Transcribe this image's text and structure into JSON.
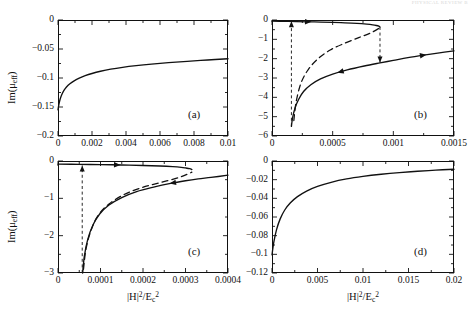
{
  "figure": {
    "header_artifact": "PHYSICAL REVIEW  B",
    "axis_title_x": "|H|2/Ec2",
    "axis_title_y": "Im(μeff)"
  },
  "chart_data": [
    {
      "type": "line",
      "panel": "(a)",
      "title": "",
      "xlabel": "|H|^2/E_c^2",
      "ylabel": "Im(mu_eff)",
      "xlim": [
        0,
        0.01
      ],
      "ylim": [
        -0.2,
        0
      ],
      "xticks": [
        0,
        0.002,
        0.004,
        0.006,
        0.008,
        0.01
      ],
      "xticklabels": [
        "0",
        "0.002",
        "0.004",
        "0.006",
        "0.008",
        "0.01"
      ],
      "yticks": [
        0,
        -0.05,
        -0.1,
        -0.15,
        -0.2
      ],
      "yticklabels": [
        "0",
        "-0.05",
        "-0.1",
        "-0.15",
        "-0.2"
      ],
      "grid": false,
      "legend": "none",
      "series": [
        {
          "name": "upper-branch",
          "style": "solid",
          "x": [
            0.0,
            5e-05,
            0.00012,
            0.00022,
            0.00035,
            0.0005,
            0.0007,
            0.00095,
            0.00125,
            0.0016,
            0.002,
            0.0025,
            0.0031,
            0.0038,
            0.0046,
            0.0055,
            0.0065,
            0.0076,
            0.0088,
            0.01
          ],
          "y": [
            -0.155,
            -0.146,
            -0.137,
            -0.129,
            -0.1215,
            -0.1155,
            -0.11,
            -0.105,
            -0.1003,
            -0.096,
            -0.0922,
            -0.0884,
            -0.0848,
            -0.0816,
            -0.0787,
            -0.076,
            -0.0735,
            -0.0712,
            -0.069,
            -0.0668
          ]
        }
      ]
    },
    {
      "type": "line",
      "panel": "(b)",
      "title": "",
      "xlabel": "|H|^2/E_c^2",
      "ylabel": "Im(mu_eff)",
      "xlim": [
        0,
        0.0015
      ],
      "ylim": [
        -6,
        0
      ],
      "xticks": [
        0,
        0.0005,
        0.001,
        0.0015
      ],
      "xticklabels": [
        "0",
        "0.0005",
        "0.001",
        "0.0015"
      ],
      "yticks": [
        0,
        -1,
        -2,
        -3,
        -4,
        -5,
        -6
      ],
      "yticklabels": [
        "0",
        "-1",
        "-2",
        "-3",
        "-4",
        "-5",
        "-6"
      ],
      "grid": false,
      "legend": "none",
      "series": [
        {
          "name": "upper-stable-branch",
          "style": "solid",
          "x": [
            0.0,
            0.0001,
            0.0002,
            0.00035,
            0.0005,
            0.0006,
            0.0007,
            0.00078,
            0.00083,
            0.00086,
            0.00088,
            0.00089
          ],
          "y": [
            -0.06,
            -0.07,
            -0.082,
            -0.1,
            -0.125,
            -0.145,
            -0.175,
            -0.215,
            -0.25,
            -0.285,
            -0.32,
            -0.36
          ]
        },
        {
          "name": "lower-stable-branch",
          "style": "solid",
          "x": [
            0.00016,
            0.00017,
            0.00019,
            0.00022,
            0.00026,
            0.00032,
            0.0004,
            0.0005,
            0.00062,
            0.00076,
            0.00089,
            0.001,
            0.00112,
            0.00125,
            0.00138,
            0.0015
          ],
          "y": [
            -5.5,
            -5.05,
            -4.55,
            -4.1,
            -3.7,
            -3.35,
            -3.05,
            -2.8,
            -2.58,
            -2.38,
            -2.22,
            -2.09,
            -1.95,
            -1.82,
            -1.7,
            -1.6
          ]
        },
        {
          "name": "unstable-branch",
          "style": "dashed",
          "x": [
            0.00018,
            0.0002,
            0.00024,
            0.0003,
            0.00038,
            0.00048,
            0.0006,
            0.00072,
            0.00082,
            0.00089
          ],
          "y": [
            -5.2,
            -4.2,
            -3.25,
            -2.55,
            -2.0,
            -1.55,
            -1.2,
            -0.9,
            -0.65,
            -0.4
          ]
        }
      ],
      "annotations": [
        {
          "kind": "jump-up-arrow",
          "style": "dashed",
          "x": 0.00016,
          "y_from": -5.5,
          "y_to": -0.07
        },
        {
          "kind": "jump-down-arrow",
          "style": "dashed",
          "x": 0.00089,
          "y_from": -0.36,
          "y_to": -2.2
        },
        {
          "kind": "direction-arrow",
          "on": "upper-stable-branch",
          "x": 0.0003,
          "direction": "right"
        },
        {
          "kind": "direction-arrow",
          "on": "lower-stable-branch",
          "x": 0.00056,
          "direction": "left"
        },
        {
          "kind": "direction-arrow",
          "on": "lower-stable-branch",
          "x": 0.00125,
          "direction": "right"
        }
      ]
    },
    {
      "type": "line",
      "panel": "(c)",
      "title": "",
      "xlabel": "|H|^2/E_c^2",
      "ylabel": "Im(mu_eff)",
      "xlim": [
        0,
        0.0004
      ],
      "ylim": [
        -3,
        0
      ],
      "xticks": [
        0,
        0.0001,
        0.0002,
        0.0003,
        0.0004
      ],
      "xticklabels": [
        "0",
        "0.0001",
        "0.0002",
        "0.0003",
        "0.0004"
      ],
      "yticks": [
        0,
        -1,
        -2,
        -3
      ],
      "yticklabels": [
        "0",
        "-1",
        "-2",
        "-3"
      ],
      "grid": false,
      "legend": "none",
      "series": [
        {
          "name": "upper-stable-branch",
          "style": "solid",
          "x": [
            0.0,
            5e-05,
            0.0001,
            0.00015,
            0.0002,
            0.00024,
            0.00027,
            0.00029,
            0.0003,
            0.00031,
            0.000315
          ],
          "y": [
            -0.085,
            -0.09,
            -0.097,
            -0.107,
            -0.12,
            -0.135,
            -0.152,
            -0.17,
            -0.185,
            -0.205,
            -0.23
          ]
        },
        {
          "name": "lower-stable-branch",
          "style": "solid",
          "x": [
            5.8e-05,
            6.2e-05,
            7e-05,
            8.2e-05,
            9.8e-05,
            0.00012,
            0.00015,
            0.000185,
            0.000225,
            0.000265,
            0.0003,
            0.00033,
            0.00036,
            0.0004
          ],
          "y": [
            -3.0,
            -2.55,
            -2.1,
            -1.72,
            -1.42,
            -1.18,
            -0.98,
            -0.82,
            -0.7,
            -0.6,
            -0.53,
            -0.48,
            -0.44,
            -0.38
          ]
        },
        {
          "name": "unstable-branch",
          "style": "dashed",
          "x": [
            6e-05,
            6.6e-05,
            7.8e-05,
            9.5e-05,
            0.00012,
            0.000155,
            0.000195,
            0.00024,
            0.000285,
            0.000315
          ],
          "y": [
            -2.9,
            -2.35,
            -1.85,
            -1.45,
            -1.15,
            -0.9,
            -0.72,
            -0.58,
            -0.44,
            -0.3
          ]
        }
      ],
      "annotations": [
        {
          "kind": "jump-up-arrow",
          "style": "dashed",
          "x": 5.7e-05,
          "y_from": -3.0,
          "y_to": -0.12
        },
        {
          "kind": "direction-arrow",
          "on": "upper-stable-branch",
          "x": 0.00014,
          "direction": "right"
        },
        {
          "kind": "direction-arrow",
          "on": "lower-stable-branch",
          "x": 0.00027,
          "direction": "left"
        }
      ]
    },
    {
      "type": "line",
      "panel": "(d)",
      "title": "",
      "xlabel": "|H|^2/E_c^2",
      "ylabel": "Im(mu_eff)",
      "xlim": [
        0,
        0.02
      ],
      "ylim": [
        -0.12,
        0
      ],
      "xticks": [
        0,
        0.005,
        0.01,
        0.015,
        0.02
      ],
      "xticklabels": [
        "0",
        "0.005",
        "0.01",
        "0.015",
        "0.02"
      ],
      "yticks": [
        0,
        -0.02,
        -0.04,
        -0.06,
        -0.08,
        -0.1,
        -0.12
      ],
      "yticklabels": [
        "0",
        "-0.02",
        "-0.04",
        "-0.06",
        "-0.08",
        "-0.1",
        "-0.12"
      ],
      "grid": false,
      "legend": "none",
      "series": [
        {
          "name": "upper-branch",
          "style": "solid",
          "x": [
            0.0,
            0.0002,
            0.0005,
            0.0009,
            0.0014,
            0.002,
            0.0028,
            0.0038,
            0.005,
            0.0065,
            0.0082,
            0.01,
            0.012,
            0.014,
            0.016,
            0.018,
            0.02
          ],
          "y": [
            -0.1005,
            -0.087,
            -0.0735,
            -0.062,
            -0.0525,
            -0.045,
            -0.0382,
            -0.0322,
            -0.0272,
            -0.0228,
            -0.0192,
            -0.0165,
            -0.0142,
            -0.0124,
            -0.011,
            -0.0098,
            -0.0088
          ]
        }
      ]
    }
  ],
  "panels": [
    {
      "tag": "(a)"
    },
    {
      "tag": "(b)"
    },
    {
      "tag": "(c)"
    },
    {
      "tag": "(d)"
    }
  ]
}
